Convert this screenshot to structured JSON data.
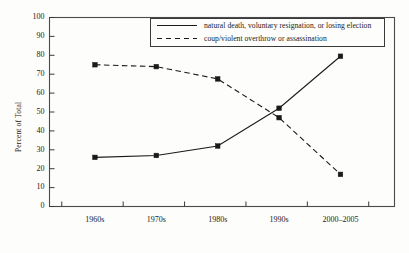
{
  "chart_data": {
    "type": "line",
    "title": "",
    "xlabel": "",
    "ylabel": "Percent of Total",
    "categories": [
      "1960s",
      "1970s",
      "1980s",
      "1990s",
      "2000–2005"
    ],
    "ylim": [
      0,
      100
    ],
    "yticks": [
      0,
      10,
      20,
      30,
      40,
      50,
      60,
      70,
      80,
      90,
      100
    ],
    "ytick_labels": [
      "0",
      "10",
      "20",
      "30",
      "40",
      "50",
      "60",
      "70",
      "80",
      "90",
      "100"
    ],
    "grid": false,
    "legend_position": "top-right-inside",
    "series": [
      {
        "name": "natural death, voluntary resignation, or losing election",
        "style": "solid",
        "color": "#1a1a1a",
        "marker": "square",
        "values": [
          26,
          27,
          32,
          52,
          79.5
        ]
      },
      {
        "name": "coup/violent overthrow or assassination",
        "style": "dashed",
        "color": "#1a1a1a",
        "marker": "square",
        "values": [
          75,
          74,
          67.5,
          47,
          17
        ]
      }
    ]
  },
  "frame": {
    "border_color": "#4a4a4a",
    "background": "#fdfdfb"
  }
}
